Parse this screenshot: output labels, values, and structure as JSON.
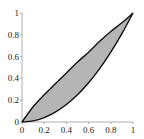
{
  "chart_data": {
    "type": "area",
    "title": "",
    "xlabel": "",
    "ylabel": "",
    "xlim": [
      0,
      1
    ],
    "ylim": [
      0,
      1
    ],
    "grid": false,
    "x_ticks": [
      "0",
      "0.2",
      "0.4",
      "0.6",
      "0.8",
      "1"
    ],
    "y_ticks": [
      "0",
      "0.2",
      "0.4",
      "0.6",
      "0.8",
      "1"
    ],
    "x": [
      0,
      0.1,
      0.2,
      0.3,
      0.4,
      0.5,
      0.6,
      0.7,
      0.8,
      0.9,
      1.0
    ],
    "series": [
      {
        "name": "upper curve",
        "values": [
          0,
          0.14,
          0.25,
          0.35,
          0.45,
          0.55,
          0.64,
          0.74,
          0.83,
          0.91,
          1.0
        ]
      },
      {
        "name": "lower curve",
        "values": [
          0,
          0.01,
          0.04,
          0.09,
          0.16,
          0.25,
          0.36,
          0.49,
          0.64,
          0.81,
          1.0
        ]
      }
    ],
    "fill_between": {
      "color": "#b5b5b5",
      "between": [
        "upper curve",
        "lower curve"
      ]
    },
    "line_color": "#111111"
  }
}
